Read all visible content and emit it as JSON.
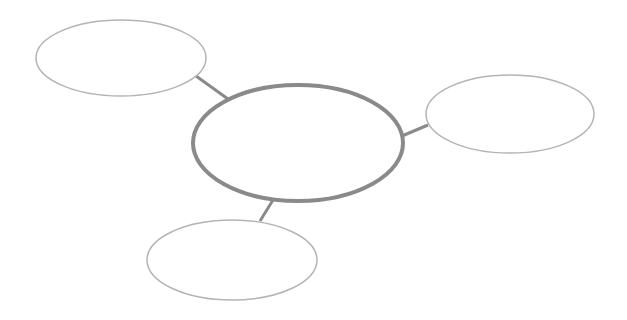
{
  "diagram": {
    "type": "mind-map",
    "center": {
      "id": "center",
      "label": "",
      "cx": 298,
      "cy": 143,
      "rx": 105,
      "ry": 58,
      "stroke": "#8a8a8a",
      "stroke_width": 4
    },
    "nodes": [
      {
        "id": "top-left",
        "label": "",
        "cx": 121,
        "cy": 58,
        "rx": 85,
        "ry": 38
      },
      {
        "id": "right",
        "label": "",
        "cx": 510,
        "cy": 114,
        "rx": 84,
        "ry": 39
      },
      {
        "id": "bottom-left",
        "label": "",
        "cx": 232,
        "cy": 260,
        "rx": 85,
        "ry": 40
      }
    ],
    "node_stroke": "#b4b4b4",
    "connector_color": "#8a8a8a"
  }
}
